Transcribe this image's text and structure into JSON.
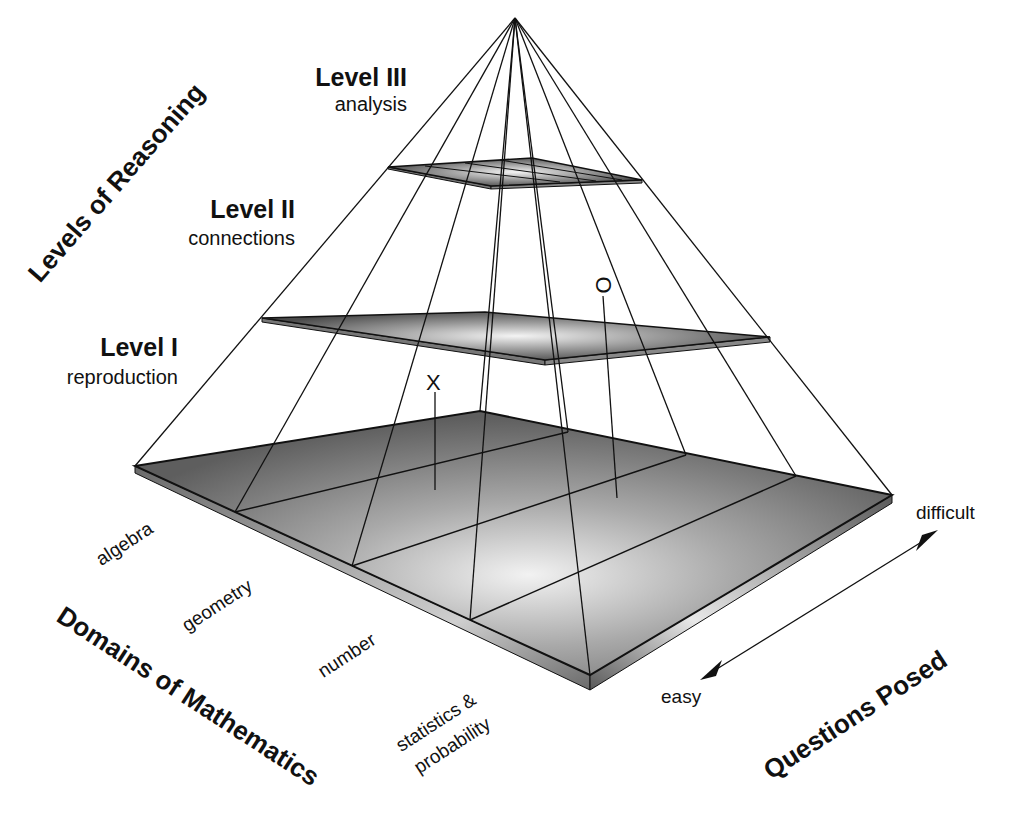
{
  "axes": {
    "vertical": "Levels of Reasoning",
    "left": "Domains of Mathematics",
    "right": "Questions Posed"
  },
  "levels": [
    {
      "title": "Level III",
      "subtitle": "analysis"
    },
    {
      "title": "Level II",
      "subtitle": "connections"
    },
    {
      "title": "Level I",
      "subtitle": "reproduction"
    }
  ],
  "domains": [
    "algebra",
    "geometry",
    "number",
    "statistics &",
    "probability"
  ],
  "difficulty": {
    "high": "difficult",
    "low": "easy"
  },
  "markers": {
    "x": "X",
    "o": "O"
  },
  "colors": {
    "slab_dark": "#5a5a5a",
    "slab_light": "#d9d9d9",
    "line": "#111111"
  }
}
